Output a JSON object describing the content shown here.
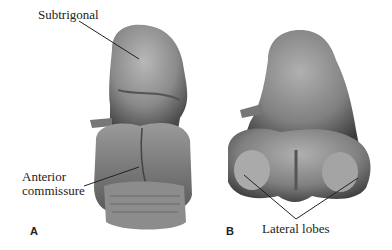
{
  "figure": {
    "labels": {
      "subtrigonal": "Subtrigonal",
      "anterior_commissure": "Anterior\ncommissure",
      "anterior_line1": "Anterior",
      "anterior_line2": "commissure",
      "lateral_lobes": "Lateral lobes"
    },
    "panels": {
      "a": "A",
      "b": "B"
    }
  }
}
